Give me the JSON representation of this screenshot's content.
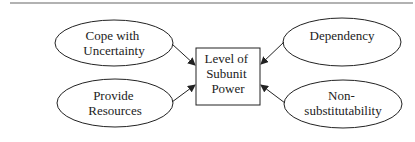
{
  "diagram": {
    "center": {
      "label_lines": [
        "Level of",
        "Subunit",
        "Power"
      ]
    },
    "factors": [
      {
        "id": "cope",
        "label_lines": [
          "Cope with",
          "Uncertainty"
        ]
      },
      {
        "id": "provide",
        "label_lines": [
          "Provide",
          "Resources"
        ]
      },
      {
        "id": "dependency",
        "label_lines": [
          "Dependency"
        ]
      },
      {
        "id": "nonsub",
        "label_lines": [
          "Non-",
          "substitutability"
        ]
      }
    ],
    "colors": {
      "stroke": "#222222",
      "rule": "#666666",
      "background": "#ffffff"
    }
  }
}
